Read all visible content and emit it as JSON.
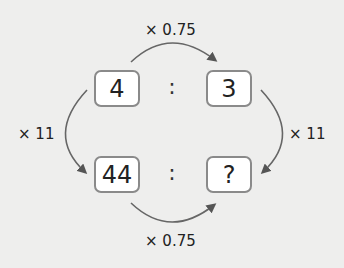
{
  "diagram": {
    "type": "ratio-scaling",
    "top_row": {
      "left": "4",
      "separator": ":",
      "right": "3"
    },
    "bottom_row": {
      "left": "44",
      "separator": ":",
      "right": "?"
    },
    "arrows": {
      "top": "× 0.75",
      "bottom": "× 0.75",
      "left": "× 11",
      "right": "× 11"
    },
    "colors": {
      "background": "#eeeeed",
      "box_border": "#8a8a8a",
      "box_fill": "#ffffff",
      "arrow": "#555555",
      "text": "#222222"
    }
  }
}
